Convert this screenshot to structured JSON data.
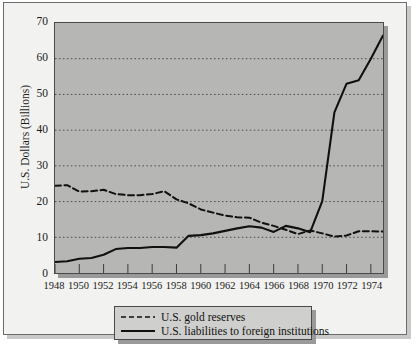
{
  "chart_data": {
    "type": "line",
    "title": "",
    "subtitle": "",
    "xlabel": "",
    "ylabel": "U.S. Dollars (Billions)",
    "xlim": [
      1948,
      1975
    ],
    "ylim": [
      0,
      70
    ],
    "ytick_step": 10,
    "xtick_step": 2,
    "grid": true,
    "grid_style": "dotted-horizontal",
    "legend_position": "below-plot-center",
    "plot_background": "#b6b6b4",
    "line_color": "#101010",
    "x": [
      1948,
      1949,
      1950,
      1951,
      1952,
      1953,
      1954,
      1955,
      1956,
      1957,
      1958,
      1959,
      1960,
      1961,
      1962,
      1963,
      1964,
      1965,
      1966,
      1967,
      1968,
      1969,
      1970,
      1971,
      1972,
      1973,
      1974,
      1975
    ],
    "xtick_labels": [
      "1948",
      "1950",
      "1952",
      "1954",
      "1956",
      "1958",
      "1960",
      "1962",
      "1964",
      "1966",
      "1968",
      "1970",
      "1972",
      "1974"
    ],
    "ytick_labels": [
      "0",
      "10",
      "20",
      "30",
      "40",
      "50",
      "60",
      "70"
    ],
    "series": [
      {
        "name": "U.S. gold reserves",
        "style": "dashed",
        "values": [
          24.4,
          24.6,
          22.8,
          22.9,
          23.3,
          22.1,
          21.8,
          21.8,
          22.1,
          22.9,
          20.6,
          19.5,
          17.8,
          16.9,
          16.1,
          15.6,
          15.5,
          14.1,
          13.2,
          12.1,
          10.9,
          11.9,
          11.1,
          10.2,
          10.5,
          11.7,
          11.7,
          11.6
        ]
      },
      {
        "name": "U.S. liabilities to foreign institutions",
        "style": "solid",
        "values": [
          3.1,
          3.3,
          4.0,
          4.2,
          5.1,
          6.7,
          7.0,
          7.0,
          7.3,
          7.3,
          7.1,
          10.4,
          10.6,
          11.1,
          11.8,
          12.5,
          13.1,
          12.7,
          11.5,
          13.2,
          12.5,
          11.4,
          20.1,
          45.0,
          53.0,
          54.0,
          60.0,
          66.5
        ]
      }
    ]
  },
  "legend": {
    "items": [
      {
        "label": "U.S. gold reserves",
        "style": "dashed"
      },
      {
        "label": "U.S. liabilities to foreign institutions",
        "style": "solid"
      }
    ]
  }
}
